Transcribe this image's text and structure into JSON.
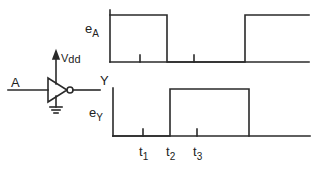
{
  "colors": {
    "ink": "#2a2a2a",
    "background": "#ffffff"
  },
  "inverter": {
    "input_label": "A",
    "output_label": "Y",
    "supply_label": {
      "main": "V",
      "sub": "dd"
    },
    "symbols": [
      "inverter-gate",
      "supply-arrow",
      "ground"
    ]
  },
  "waveforms": {
    "eA": {
      "label": {
        "main": "e",
        "sub": "A"
      },
      "description": "high 0–t2, low t2–~t4, high after"
    },
    "eY": {
      "label": {
        "main": "e",
        "sub": "Y"
      },
      "description": "low 0–t2, high t2–~t4, low after"
    }
  },
  "time_markers": [
    {
      "main": "t",
      "sub": "1"
    },
    {
      "main": "t",
      "sub": "2"
    },
    {
      "main": "t",
      "sub": "3"
    }
  ]
}
